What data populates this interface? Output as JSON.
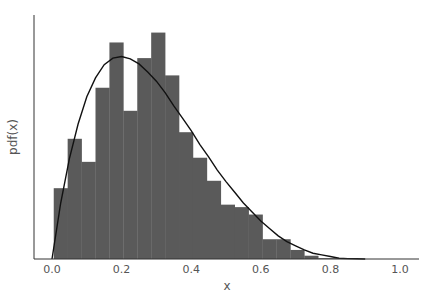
{
  "chart_data": {
    "type": "bar",
    "subtype": "histogram_with_pdf_curve",
    "title": "",
    "xlabel": "x",
    "ylabel": "pdf(x)",
    "xlim": [
      -0.05,
      1.05
    ],
    "ylim": [
      0,
      3.0
    ],
    "grid": false,
    "legend": null,
    "xticks": [
      "0.0",
      "0.2",
      "0.4",
      "0.6",
      "0.8",
      "1.0"
    ],
    "xtick_values": [
      0.0,
      0.2,
      0.4,
      0.6,
      0.8,
      1.0
    ],
    "yticks": [],
    "bar_color": "#5a5a5a",
    "curve_color": "#111111",
    "bins": {
      "edges": [
        0.005,
        0.045,
        0.085,
        0.125,
        0.165,
        0.205,
        0.245,
        0.285,
        0.325,
        0.365,
        0.405,
        0.445,
        0.485,
        0.525,
        0.565,
        0.605,
        0.645,
        0.685,
        0.725,
        0.765,
        0.805,
        0.845
      ],
      "heights": [
        0.86,
        1.46,
        1.18,
        2.08,
        2.63,
        1.8,
        2.44,
        2.75,
        2.23,
        1.54,
        1.23,
        0.95,
        0.66,
        0.63,
        0.54,
        0.24,
        0.24,
        0.11,
        0.04,
        0.01,
        0.01
      ]
    },
    "curve": {
      "label": "Beta(2,5)-shaped pdf",
      "x": [
        0.0,
        0.025,
        0.05,
        0.075,
        0.1,
        0.125,
        0.15,
        0.175,
        0.2,
        0.225,
        0.25,
        0.275,
        0.3,
        0.325,
        0.35,
        0.375,
        0.4,
        0.425,
        0.45,
        0.475,
        0.5,
        0.525,
        0.55,
        0.575,
        0.6,
        0.625,
        0.65,
        0.675,
        0.7,
        0.725,
        0.75,
        0.775,
        0.8,
        0.825,
        0.85,
        0.875,
        0.9
      ],
      "y": [
        0.0,
        0.68,
        1.22,
        1.64,
        1.97,
        2.2,
        2.36,
        2.44,
        2.46,
        2.43,
        2.37,
        2.27,
        2.16,
        2.02,
        1.86,
        1.71,
        1.56,
        1.39,
        1.24,
        1.08,
        0.94,
        0.81,
        0.68,
        0.57,
        0.46,
        0.37,
        0.28,
        0.21,
        0.16,
        0.11,
        0.07,
        0.05,
        0.03,
        0.01,
        0.005,
        0.002,
        0.0
      ]
    }
  }
}
